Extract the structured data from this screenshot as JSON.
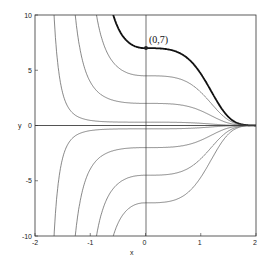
{
  "chart_data": {
    "type": "line",
    "title": "",
    "xlabel": "x",
    "ylabel": "y",
    "xlim": [
      -2,
      2
    ],
    "ylim": [
      -10,
      10
    ],
    "xticks": [
      "-2",
      "-1",
      "0",
      "1",
      "2"
    ],
    "yticks": [
      "10",
      "5",
      "0",
      "-5",
      "-10"
    ],
    "grid": false,
    "annotation": {
      "text": "(0,7)",
      "x": 0,
      "y": 7
    },
    "series": [
      {
        "name": "C=7 (highlighted)",
        "initial_value": 7,
        "bold": true
      },
      {
        "name": "C=4.5",
        "initial_value": 4.5
      },
      {
        "name": "C=2",
        "initial_value": 2
      },
      {
        "name": "C=0.3",
        "initial_value": 0.3
      },
      {
        "name": "C=0",
        "initial_value": 0
      },
      {
        "name": "C=-0.3",
        "initial_value": -0.3
      },
      {
        "name": "C=-2",
        "initial_value": -2
      },
      {
        "name": "C=-4.5",
        "initial_value": -4.5
      },
      {
        "name": "C=-7",
        "initial_value": -7
      }
    ]
  }
}
